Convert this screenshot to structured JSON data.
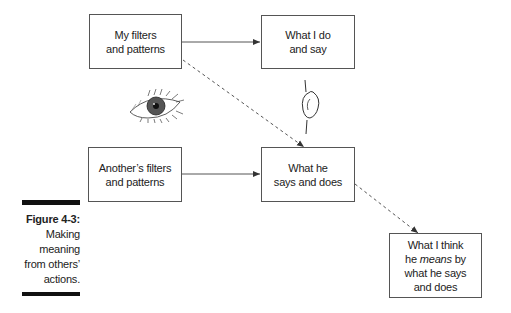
{
  "boxes": {
    "my_filters": {
      "line1": "My filters",
      "line2": "and patterns"
    },
    "what_i_do": {
      "line1": "What I do",
      "line2": "and say"
    },
    "another_filters": {
      "line1": "Another’s filters",
      "line2": "and patterns"
    },
    "what_he_says": {
      "line1": "What he",
      "line2": "says and does"
    },
    "what_i_think": {
      "line1": "What I think",
      "line2_pre": "he ",
      "line2_em": "means",
      "line2_post": " by",
      "line3": "what he says",
      "line4": "and does"
    }
  },
  "illustrations": {
    "eye": "eye-icon",
    "ear": "ear-icon"
  },
  "caption": {
    "figure_label": "Figure 4-3:",
    "lines": [
      "Making",
      "meaning",
      "from others’",
      "actions."
    ]
  },
  "colors": {
    "line": "#444444",
    "box_border": "#555555",
    "bar": "#111111"
  }
}
